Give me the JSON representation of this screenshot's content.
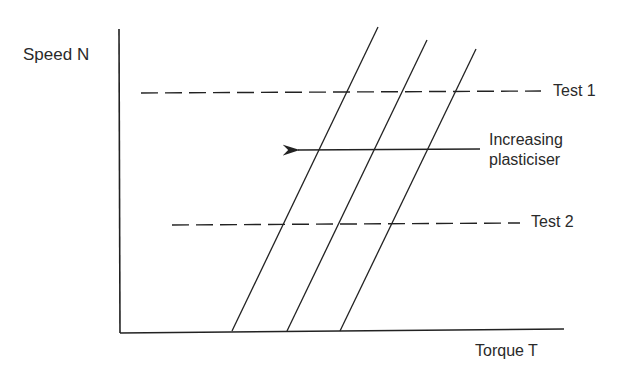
{
  "diagram": {
    "y_axis_label": "Speed N",
    "x_axis_label": "Torque T",
    "test_lines": [
      {
        "label": "Test 1"
      },
      {
        "label": "Test 2"
      }
    ],
    "annotation": {
      "line1": "Increasing",
      "line2": "plasticiser"
    },
    "curves": [
      {
        "name": "curve-1"
      },
      {
        "name": "curve-2"
      },
      {
        "name": "curve-3"
      }
    ],
    "colors": {
      "ink": "#222222",
      "background": "#ffffff"
    }
  }
}
